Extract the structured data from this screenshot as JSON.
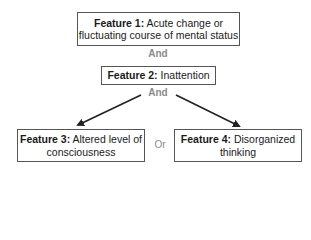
{
  "diagram": {
    "features": [
      {
        "id": "feature-1",
        "label": "Feature 1:",
        "text": "Acute change or fluctuating course of mental status"
      },
      {
        "id": "feature-2",
        "label": "Feature 2:",
        "text": "Inattention"
      },
      {
        "id": "feature-3",
        "label": "Feature 3:",
        "text": "Altered level of consciousness"
      },
      {
        "id": "feature-4",
        "label": "Feature 4:",
        "text": "Disorganized thinking"
      }
    ],
    "connectors": {
      "and_1": "And",
      "and_2": "And",
      "or": "Or"
    },
    "colors": {
      "box_border": "#555555",
      "connector_text": "#8a8a8a",
      "arrow": "#222222"
    }
  }
}
